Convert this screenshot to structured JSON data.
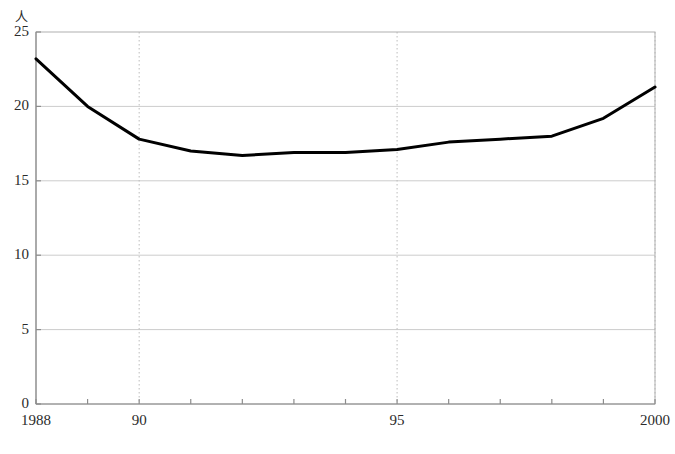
{
  "chart_data": {
    "type": "line",
    "title": "",
    "subtitle": "",
    "xlabel": "",
    "ylabel": "",
    "yunit": "人",
    "x": [
      1988,
      1989,
      1990,
      1991,
      1992,
      1993,
      1994,
      1995,
      1996,
      1997,
      1998,
      1999,
      2000
    ],
    "values": [
      23.2,
      20.0,
      17.8,
      17.0,
      16.7,
      16.9,
      16.9,
      17.1,
      17.6,
      17.8,
      18.0,
      19.2,
      21.3
    ],
    "series": [
      {
        "name": "",
        "values": [
          23.2,
          20.0,
          17.8,
          17.0,
          16.7,
          16.9,
          16.9,
          17.1,
          17.6,
          17.8,
          18.0,
          19.2,
          21.3
        ],
        "color": "#000000"
      }
    ],
    "xlim": [
      1988,
      2000
    ],
    "ylim": [
      0,
      25
    ],
    "y_ticks": [
      0,
      5,
      10,
      15,
      20,
      25
    ],
    "y_tick_labels": [
      "0",
      "5",
      "10",
      "15",
      "20",
      "25"
    ],
    "x_ticks": [
      1988,
      1989,
      1990,
      1991,
      1992,
      1993,
      1994,
      1995,
      1996,
      1997,
      1998,
      1999,
      2000
    ],
    "x_tick_labels": [
      {
        "value": 1988,
        "label": "1988"
      },
      {
        "value": 1990,
        "label": "90"
      },
      {
        "value": 1995,
        "label": "95"
      },
      {
        "value": 2000,
        "label": "2000"
      }
    ],
    "x_gridlines": [
      1990,
      1995,
      2000
    ],
    "grid": {
      "horizontal": true,
      "vertical": true,
      "horizontal_style": "solid",
      "vertical_style": "dotted",
      "color": "#cccccc"
    },
    "legend": {
      "visible": false,
      "position": "none"
    },
    "frame": {
      "visible": true,
      "color": "#b0b0b0"
    },
    "line_color": "#000000",
    "line_width": 3,
    "markers": false
  },
  "caption": {
    "text": ""
  }
}
